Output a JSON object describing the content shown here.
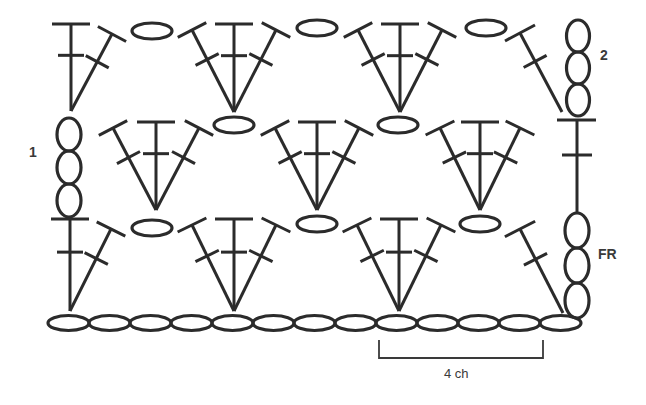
{
  "diagram": {
    "type": "crochet-stitch-chart",
    "stroke_color": "#2b2b2b",
    "background": "#ffffff",
    "labels": {
      "row1": "1",
      "row2": "2",
      "foundation": "FR",
      "repeat": "4 ch"
    },
    "foundation_chain": {
      "count": 13,
      "y": 323,
      "start_x": 48,
      "oval_width": 41,
      "oval_height": 15
    },
    "turning_chains": [
      {
        "name": "left-turning-chain-row1",
        "x": 69,
        "y_top": 118,
        "count": 3,
        "oval_height": 33,
        "oval_width": 24
      },
      {
        "name": "right-turning-chain-row2",
        "x": 578,
        "y_top": 20,
        "count": 3,
        "oval_height": 32,
        "oval_width": 23
      },
      {
        "name": "right-turning-chain-foundation",
        "x": 577,
        "y_top": 213,
        "count": 3,
        "oval_height": 35,
        "oval_width": 24
      }
    ],
    "fans": [
      {
        "row": "row1",
        "apex": [
          234,
          311
        ],
        "top_y": 219,
        "spread": 42
      },
      {
        "row": "row1",
        "apex": [
          399,
          311
        ],
        "top_y": 219,
        "spread": 42
      },
      {
        "row": "row2-mid",
        "apex": [
          156,
          210
        ],
        "top_y": 122,
        "spread": 43
      },
      {
        "row": "row2-mid",
        "apex": [
          317,
          210
        ],
        "top_y": 122,
        "spread": 42
      },
      {
        "row": "row2-mid",
        "apex": [
          480,
          210
        ],
        "top_y": 122,
        "spread": 40
      },
      {
        "row": "row2",
        "apex": [
          234,
          112
        ],
        "top_y": 24,
        "spread": 42
      },
      {
        "row": "row2",
        "apex": [
          400,
          112
        ],
        "top_y": 24,
        "spread": 42
      }
    ],
    "half_fans_left": [
      {
        "apex": [
          70,
          311
        ],
        "top_y": 219
      },
      {
        "apex": [
          71,
          111
        ],
        "top_y": 24
      }
    ],
    "single_dc_right": [
      {
        "base": [
          563,
          313
        ],
        "top": [
          520,
          229
        ]
      },
      {
        "base": [
          562,
          112
        ],
        "top": [
          520,
          33
        ]
      }
    ],
    "chain_spaces": [
      {
        "cx": 152,
        "cy": 228
      },
      {
        "cx": 317,
        "cy": 224
      },
      {
        "cx": 480,
        "cy": 224
      },
      {
        "cx": 234,
        "cy": 125
      },
      {
        "cx": 398,
        "cy": 125
      },
      {
        "cx": 152,
        "cy": 31
      },
      {
        "cx": 317,
        "cy": 28
      },
      {
        "cx": 486,
        "cy": 28
      }
    ],
    "right_post": {
      "x": 577,
      "top_y": 120,
      "bottom_y": 213
    },
    "repeat_bracket": {
      "x1": 379,
      "x2": 543,
      "y_top": 340,
      "y_bottom": 358
    }
  }
}
